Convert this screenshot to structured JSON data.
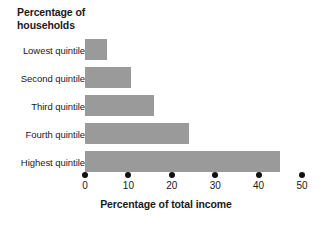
{
  "chart_data": {
    "type": "bar",
    "orientation": "horizontal",
    "title": "",
    "ylabel": "Percentage of\nhouseholds",
    "xlabel": "Percentage of total income",
    "categories": [
      "Lowest quintile",
      "Second quintile",
      "Third quintile",
      "Fourth quintile",
      "Highest quintile"
    ],
    "values": [
      5,
      10.5,
      16,
      24,
      45
    ],
    "xlim": [
      0,
      50
    ],
    "xticks": [
      0,
      10,
      20,
      30,
      40,
      50
    ],
    "xtick_labels": [
      "0",
      "10",
      "20",
      "30",
      "40",
      "50"
    ],
    "grid": false,
    "legend": false,
    "bar_color": "#9a9a9a",
    "axis_color": "#111111",
    "background_color": "#ffffff"
  }
}
